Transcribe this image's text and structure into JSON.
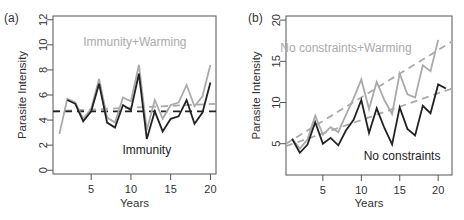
{
  "chart_data": [
    {
      "type": "line",
      "panel_label": "(a)",
      "title": "",
      "xlabel": "Years",
      "ylabel": "Parasite Intensity",
      "xlim": [
        0.2,
        20.7
      ],
      "ylim": [
        -0.3,
        12.3
      ],
      "xticks": [
        5,
        10,
        15,
        20
      ],
      "yticks": [
        0,
        2,
        4,
        6,
        8,
        10,
        12
      ],
      "grid": false,
      "annotations": [
        {
          "text": "Immunity+Warming",
          "color": "#aaaaaa",
          "x": 10.5,
          "y": 9.9
        },
        {
          "text": "Immunity",
          "color": "#222222",
          "x": 12,
          "y": 1.3
        }
      ],
      "series": [
        {
          "name": "Immunity+Warming",
          "color": "#aaaaaa",
          "x": [
            1,
            2,
            3,
            4,
            5,
            6,
            7,
            8,
            9,
            10,
            11,
            12,
            13,
            14,
            15,
            16,
            17,
            18,
            19,
            20
          ],
          "values": [
            2.9,
            5.7,
            5.4,
            4.1,
            4.9,
            7.3,
            4.2,
            3.8,
            5.8,
            5.5,
            8.4,
            3.2,
            5.6,
            4.1,
            5.2,
            5.4,
            6.8,
            5.1,
            5.9,
            8.4
          ]
        },
        {
          "name": "Immunity",
          "color": "#222222",
          "x": [
            2,
            3,
            4,
            5,
            6,
            7,
            8,
            9,
            10,
            11,
            12,
            13,
            14,
            15,
            16,
            17,
            18,
            19,
            20
          ],
          "values": [
            5.6,
            5.3,
            3.9,
            4.7,
            6.9,
            3.8,
            3.4,
            5.2,
            4.8,
            7.7,
            2.5,
            4.7,
            3.1,
            4.1,
            4.3,
            5.6,
            3.7,
            4.6,
            7.0
          ]
        }
      ],
      "trend_lines": [
        {
          "name": "Immunity+Warming trend",
          "color": "#aaaaaa",
          "x": [
            0.2,
            20.7
          ],
          "values": [
            4.7,
            5.3
          ]
        },
        {
          "name": "Immunity trend",
          "color": "#222222",
          "x": [
            0.2,
            20.7
          ],
          "values": [
            4.7,
            4.7
          ]
        }
      ]
    },
    {
      "type": "line",
      "panel_label": "(b)",
      "title": "",
      "xlabel": "Years",
      "ylabel": "Parasite Intensity",
      "xlim": [
        0.2,
        21.8
      ],
      "ylim": [
        1.2,
        20.5
      ],
      "xticks": [
        5,
        10,
        15,
        20
      ],
      "yticks": [
        5,
        10,
        15,
        20
      ],
      "grid": false,
      "annotations": [
        {
          "text": "No constraints+Warming",
          "color": "#aaaaaa",
          "x": 8,
          "y": 16.1
        },
        {
          "text": "No constraints",
          "color": "#222222",
          "x": 15.3,
          "y": 3.0
        }
      ],
      "series": [
        {
          "name": "No constraints+Warming",
          "color": "#aaaaaa",
          "x": [
            1,
            2,
            3,
            4,
            5,
            6,
            7,
            8,
            9,
            10,
            11,
            12,
            13,
            14,
            15,
            16,
            17,
            18,
            19,
            20
          ],
          "values": [
            5.6,
            4.4,
            5.5,
            8.4,
            6.1,
            7.0,
            6.4,
            8.5,
            10.5,
            12.8,
            9.2,
            12.5,
            10.3,
            8.6,
            13.5,
            11.0,
            10.6,
            14.5,
            13.8,
            17.6
          ]
        },
        {
          "name": "No constraints",
          "color": "#222222",
          "x": [
            1,
            2,
            3,
            4,
            5,
            6,
            7,
            8,
            9,
            10,
            11,
            12,
            13,
            14,
            15,
            16,
            17,
            18,
            19,
            20,
            21
          ],
          "values": [
            5.6,
            3.9,
            4.9,
            7.6,
            5.0,
            5.7,
            4.8,
            6.6,
            7.9,
            10.3,
            6.3,
            9.3,
            6.9,
            4.9,
            9.4,
            6.8,
            6.0,
            9.6,
            8.7,
            12.2,
            11.7
          ]
        }
      ],
      "trend_lines": [
        {
          "name": "No constraints+Warming trend",
          "color": "#aaaaaa",
          "x": [
            0.2,
            21.8
          ],
          "values": [
            5.0,
            17.4
          ]
        },
        {
          "name": "No constraints trend",
          "color": "#aaaaaa",
          "x": [
            0.2,
            21.8
          ],
          "values": [
            4.7,
            11.7
          ]
        }
      ]
    }
  ]
}
